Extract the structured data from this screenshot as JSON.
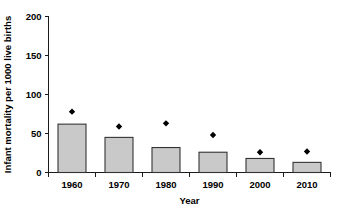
{
  "chart_data": {
    "type": "bar",
    "title": "",
    "subtitle": "",
    "xlabel": "Year",
    "ylabel": "Infant mortality per 1000 live births",
    "categories": [
      "1960",
      "1970",
      "1980",
      "1990",
      "2000",
      "2010"
    ],
    "series": [
      {
        "name": "Infant mortality rate (bars)",
        "type": "bar",
        "values": [
          62,
          45,
          32,
          26,
          18,
          13
        ]
      },
      {
        "name": "Marker values (diamonds)",
        "type": "scatter",
        "marker": "diamond",
        "values": [
          78,
          59,
          63,
          48,
          26,
          27
        ]
      }
    ],
    "ylim": [
      0,
      200
    ],
    "yticks": [
      0,
      50,
      100,
      150,
      200
    ],
    "ytick_labels": [
      "0",
      "50",
      "100",
      "150",
      "200"
    ],
    "xtick_labels": [
      "1960",
      "1970",
      "1980",
      "1990",
      "2000",
      "2010"
    ],
    "grid": false,
    "legend": false,
    "legend_position": "none",
    "colors": {
      "bar_fill": "#c9c9c9",
      "bar_border": "#333333",
      "marker": "#000000",
      "axis": "#1a1a1a",
      "text": "#000000",
      "background": "#ffffff"
    }
  }
}
